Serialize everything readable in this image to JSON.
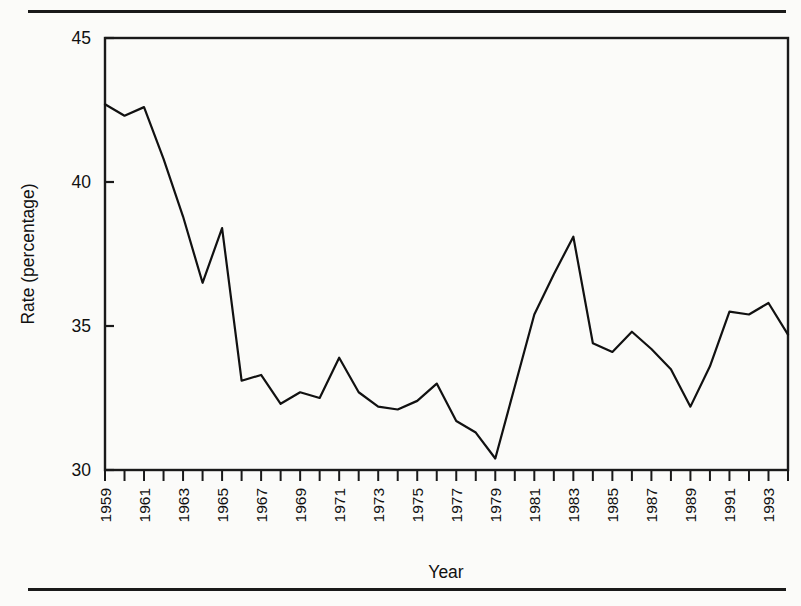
{
  "chart_data": {
    "type": "line",
    "title": "",
    "xlabel": "Year",
    "ylabel": "Rate (percentage)",
    "xlim": [
      1959,
      1994
    ],
    "ylim": [
      30,
      45
    ],
    "grid": false,
    "legend_position": "none",
    "y_ticks": [
      30,
      35,
      40,
      45
    ],
    "y_tick_labels": [
      "30",
      "35",
      "40",
      "45"
    ],
    "x_tick_labels": [
      "1959",
      "1961",
      "1963",
      "1965",
      "1967",
      "1969",
      "1971",
      "1973",
      "1975",
      "1977",
      "1979",
      "1981",
      "1983",
      "1985",
      "1987",
      "1989",
      "1991",
      "1993"
    ],
    "x": [
      1959,
      1960,
      1961,
      1962,
      1963,
      1964,
      1965,
      1966,
      1967,
      1968,
      1969,
      1970,
      1971,
      1972,
      1973,
      1974,
      1975,
      1976,
      1977,
      1978,
      1979,
      1980,
      1981,
      1982,
      1983,
      1984,
      1985,
      1986,
      1987,
      1988,
      1989,
      1990,
      1991,
      1992,
      1993,
      1994
    ],
    "values": [
      42.7,
      42.3,
      42.6,
      40.8,
      38.8,
      36.5,
      38.4,
      33.1,
      33.3,
      32.3,
      32.7,
      32.5,
      33.9,
      32.7,
      32.2,
      32.1,
      32.4,
      33.0,
      31.7,
      31.3,
      30.4,
      32.9,
      35.4,
      36.8,
      38.1,
      34.4,
      34.1,
      34.8,
      34.2,
      33.5,
      32.2,
      33.6,
      35.5,
      35.4,
      35.8,
      34.7
    ],
    "series_name": "Rate",
    "line_color": "#111111",
    "line_width": 2.2
  },
  "axes_geometry": {
    "plot_left": 105,
    "plot_right": 788,
    "plot_top": 38,
    "plot_bottom": 470
  }
}
